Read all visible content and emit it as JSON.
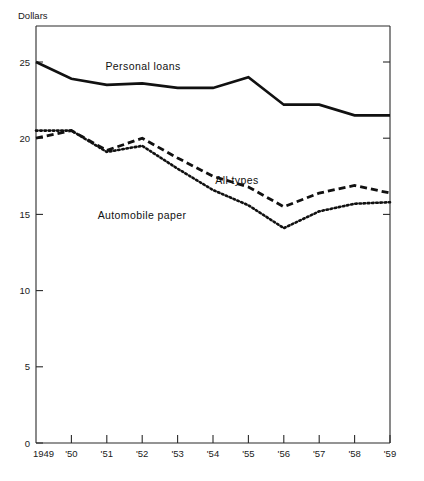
{
  "chart_data": {
    "type": "line",
    "title": "",
    "subtitle": "",
    "xlabel": "",
    "ylabel": "Dollars",
    "ylim": [
      0,
      27.5
    ],
    "yticks": [
      0,
      5,
      10,
      15,
      20,
      25
    ],
    "ytick_labels": [
      "0",
      "5",
      "10",
      "15",
      "20",
      "25"
    ],
    "grid": false,
    "legend_position": "inline-annotations",
    "x": [
      1949,
      1950,
      1951,
      1952,
      1953,
      1954,
      1955,
      1956,
      1957,
      1958,
      1959
    ],
    "categories": [
      "1949",
      "'50",
      "'51",
      "'52",
      "'53",
      "'54",
      "'55",
      "'56",
      "'57",
      "'58",
      "'59"
    ],
    "series": [
      {
        "name": "Personal loans",
        "style": "solid",
        "values": [
          25.0,
          23.9,
          23.5,
          23.6,
          23.3,
          23.3,
          24.0,
          22.2,
          22.2,
          21.5,
          21.5
        ]
      },
      {
        "name": "All types",
        "style": "dashed",
        "values": [
          20.0,
          20.5,
          19.2,
          20.0,
          18.7,
          17.5,
          16.8,
          15.5,
          16.4,
          16.9,
          16.4
        ]
      },
      {
        "name": "Automobile paper",
        "style": "dotted",
        "values": [
          20.5,
          20.5,
          19.1,
          19.5,
          18.0,
          16.6,
          15.6,
          14.1,
          15.2,
          15.7,
          15.8
        ]
      }
    ],
    "annotations": [
      {
        "text": "Personal loans",
        "x_px": 143,
        "y_px": 70
      },
      {
        "text": "All types",
        "x_px": 237,
        "y_px": 184
      },
      {
        "text": "Automobile paper",
        "x_px": 142,
        "y_px": 219
      }
    ],
    "colors": {
      "line": "#111111",
      "axis": "#2a2a2a",
      "background": "#ffffff"
    }
  },
  "axes": {
    "y_caption": "Dollars",
    "y_caption_label": "Dollars"
  }
}
